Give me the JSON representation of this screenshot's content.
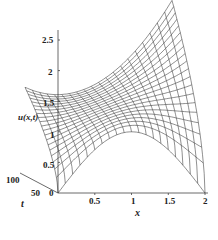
{
  "chart_data": {
    "type": "surface3d",
    "title": "",
    "xlabel": "x",
    "ylabel": "t",
    "zlabel": "u(x,t)",
    "x_ticks": [
      "0.5",
      "1",
      "1.5",
      "2"
    ],
    "t_ticks": [
      "0",
      "50",
      "100"
    ],
    "z_ticks": [
      "0.5",
      "1",
      "1.5",
      "2",
      "2.5"
    ],
    "x_range": [
      0,
      2
    ],
    "t_range": [
      0,
      100
    ],
    "z_range": [
      0,
      2.6
    ],
    "grid": false,
    "style": "wireframe",
    "line_color": "#333333",
    "surface_samples": {
      "t_0": {
        "x": [
          0,
          0.5,
          1,
          1.5,
          2
        ],
        "u": [
          0,
          0.71,
          1.0,
          0.71,
          0
        ]
      },
      "t_100": {
        "x": [
          0,
          0.5,
          1,
          1.5,
          2
        ],
        "u": [
          1.45,
          1.1,
          1.3,
          1.9,
          2.65
        ]
      }
    },
    "x_lines": 21,
    "t_lines": 21
  },
  "labels": {
    "x": "x",
    "t": "t",
    "z": "u(x,t)",
    "origin": "0"
  }
}
